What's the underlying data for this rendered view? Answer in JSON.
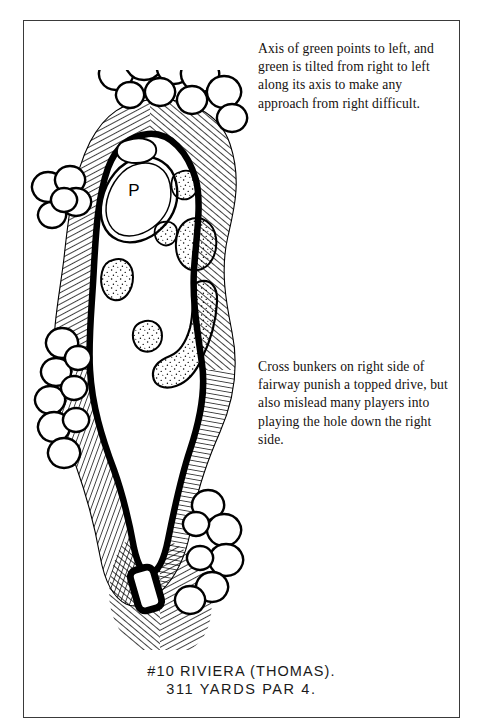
{
  "page": {
    "background_color": "#ffffff",
    "frame_color": "#3a3a3a"
  },
  "annotations": {
    "green_note": "Axis of green points to left, and green is tilted from right to left along its axis to make any approach from right difficult.",
    "bunker_note": "Cross bunkers on right side of fairway punish a topped drive, but also mislead many players into playing the hole down the right side."
  },
  "caption": {
    "line1": "#10 RIVIERA (THOMAS).",
    "line2": "311 YARDS   PAR 4."
  },
  "hole": {
    "number": "#10",
    "course": "RIVIERA",
    "architect": "THOMAS",
    "yards": "311",
    "par": "4",
    "pin_marker": "P"
  },
  "art": {
    "ink_color": "#000000",
    "sand_fill": "#ffffff",
    "style": "pen-and-ink golf hole plan",
    "features": [
      "green with pin",
      "greenside bunkers",
      "cross bunkers right of fairway",
      "fairway corridor",
      "tree clusters both sides",
      "tee box"
    ]
  }
}
